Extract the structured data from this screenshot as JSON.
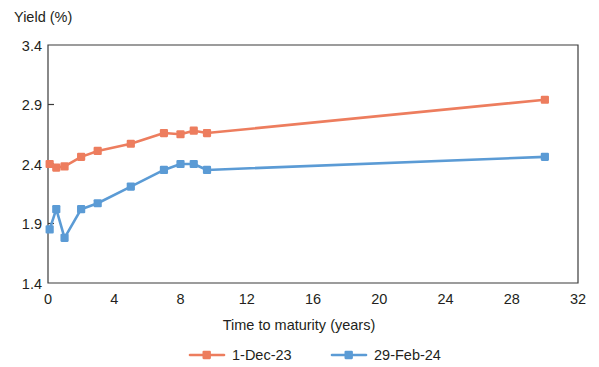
{
  "chart_data": {
    "type": "line",
    "title": "",
    "xlabel": "Time to maturity (years)",
    "ylabel": "Yield (%)",
    "xlim": [
      0,
      32
    ],
    "ylim": [
      1.4,
      3.4
    ],
    "xticks": [
      0,
      4,
      8,
      12,
      16,
      20,
      24,
      28,
      32
    ],
    "xtick_labels": [
      "0",
      "4",
      "8",
      "12",
      "16",
      "20",
      "24",
      "28",
      "32"
    ],
    "yticks": [
      1.4,
      1.9,
      2.4,
      2.9,
      3.4
    ],
    "ytick_labels": [
      "1.4",
      "1.9",
      "2.4",
      "2.9",
      "3.4"
    ],
    "grid": false,
    "legend_position": "bottom",
    "series": [
      {
        "name": "1-Dec-23",
        "color": "#ED7D5E",
        "marker": "square",
        "x": [
          0.1,
          0.5,
          1.0,
          2.0,
          3.0,
          5.0,
          7.0,
          8.0,
          8.8,
          9.6,
          30.0
        ],
        "y": [
          2.4,
          2.37,
          2.38,
          2.46,
          2.51,
          2.57,
          2.66,
          2.65,
          2.68,
          2.66,
          2.94
        ]
      },
      {
        "name": "29-Feb-24",
        "color": "#5B9BD5",
        "marker": "square",
        "x": [
          0.1,
          0.5,
          1.0,
          2.0,
          3.0,
          5.0,
          7.0,
          8.0,
          8.8,
          9.6,
          30.0
        ],
        "y": [
          1.85,
          2.02,
          1.78,
          2.02,
          2.07,
          2.21,
          2.35,
          2.4,
          2.4,
          2.35,
          2.46
        ]
      }
    ]
  },
  "legend": {
    "items": [
      {
        "label": "1-Dec-23",
        "color": "#ED7D5E"
      },
      {
        "label": "29-Feb-24",
        "color": "#5B9BD5"
      }
    ]
  }
}
